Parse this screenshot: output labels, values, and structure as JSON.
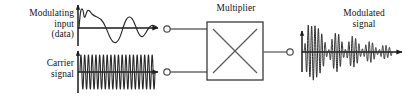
{
  "diagram": {
    "title_implicit": "Amplitude modulation block diagram",
    "labels": {
      "modulating_line1": "Modulating",
      "modulating_line2": "input",
      "modulating_line3": "(data)",
      "carrier_line1": "Carrier",
      "carrier_line2": "signal",
      "multiplier": "Multiplier",
      "out": "Out",
      "modulated_line1": "Modulated",
      "modulated_line2": "signal"
    },
    "colors": {
      "ink": "#1a1a1a",
      "wire": "#555555",
      "trace": "#222222",
      "background": "#ffffff"
    },
    "block": {
      "name": "Multiplier",
      "x": 207,
      "y": 22,
      "width": 56,
      "height": 58,
      "inputs": 2,
      "outputs": 1,
      "symbol": "cross-x"
    },
    "terminals": [
      {
        "name": "modulating-input-terminal",
        "cx": 167,
        "cy": 29,
        "r": 3.2
      },
      {
        "name": "carrier-input-terminal",
        "cx": 167,
        "cy": 72,
        "r": 3.2
      },
      {
        "name": "output-terminal",
        "cx": 290,
        "cy": 52,
        "r": 3.2
      }
    ]
  },
  "chart_data": [
    {
      "type": "line",
      "name": "modulating-input-waveform",
      "title": "Modulating input (data)",
      "xlabel": "",
      "ylabel": "",
      "grid": false,
      "axis_origin": [
        78,
        28
      ],
      "axis_x_end": 160,
      "axis_y_top": 4,
      "description": "damped low-frequency oscillation with initial notched peak",
      "x": [
        0,
        2,
        4,
        6,
        8,
        10,
        12,
        14,
        16,
        18,
        20,
        22,
        24,
        26,
        28,
        30,
        32,
        34,
        36,
        38,
        40,
        42,
        44,
        46,
        48,
        50,
        52,
        54,
        56,
        58,
        60,
        62,
        64,
        66,
        68,
        70,
        72,
        74,
        76,
        78,
        80
      ],
      "y": [
        0,
        14,
        21,
        18,
        22,
        20,
        19,
        17,
        14,
        10,
        5,
        0,
        -6,
        -11,
        -14,
        -15,
        -13,
        -9,
        -4,
        1,
        6,
        10,
        12,
        11,
        9,
        6,
        2,
        -2,
        -5,
        -7,
        -8,
        -7,
        -5,
        -2,
        1,
        3,
        5,
        5,
        4,
        3,
        2
      ]
    },
    {
      "type": "line",
      "name": "carrier-waveform",
      "title": "Carrier signal",
      "xlabel": "",
      "ylabel": "",
      "grid": false,
      "axis_origin": [
        78,
        72
      ],
      "axis_x_end": 160,
      "axis_y_top": 50,
      "description": "constant-amplitude high-frequency sinusoid, about 20 cycles",
      "cycles": 20,
      "amplitude": 17,
      "x_start": 80,
      "x_end": 155
    },
    {
      "type": "line",
      "name": "modulated-waveform",
      "title": "Modulated signal",
      "xlabel": "",
      "ylabel": "",
      "grid": false,
      "axis_origin": [
        302,
        52
      ],
      "axis_x_end": 404,
      "axis_y_top": 30,
      "description": "AM wave: carrier amplitude follows the decaying modulating envelope",
      "cycles": 26,
      "envelope_x": [
        0,
        2,
        4,
        6,
        8,
        10,
        12,
        14,
        16,
        18,
        20,
        22,
        24,
        26,
        28,
        30,
        32,
        34,
        36,
        38,
        40,
        42,
        44,
        46,
        48,
        50,
        52,
        54,
        56,
        58,
        60,
        62,
        64,
        66,
        68,
        70,
        72,
        74,
        76,
        78,
        80
      ],
      "envelope_y": [
        0,
        14,
        21,
        18,
        22,
        20,
        19,
        17,
        14,
        10,
        5,
        0,
        6,
        11,
        14,
        15,
        13,
        9,
        4,
        1,
        6,
        10,
        12,
        11,
        9,
        6,
        2,
        2,
        5,
        7,
        8,
        7,
        5,
        2,
        1,
        3,
        5,
        5,
        4,
        3,
        2
      ]
    }
  ]
}
